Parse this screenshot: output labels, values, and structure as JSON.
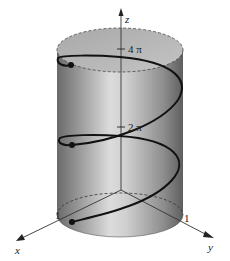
{
  "figure": {
    "axes": {
      "x_label": "x",
      "y_label": "y",
      "z_label": "z"
    },
    "ticks": {
      "z_upper": "4 π",
      "z_lower": "2 π",
      "x_tick": "1",
      "y_tick": "1"
    },
    "colors": {
      "cylinder_dark": "#6e6e6e",
      "cylinder_light": "#d6d6d6",
      "top_cap": "#b9b9b9",
      "helix": "#111111",
      "axis": "#333333"
    },
    "points": [
      {
        "name": "start",
        "label": ""
      },
      {
        "name": "after-one-turn",
        "label": ""
      },
      {
        "name": "after-two-turns",
        "label": ""
      }
    ]
  }
}
